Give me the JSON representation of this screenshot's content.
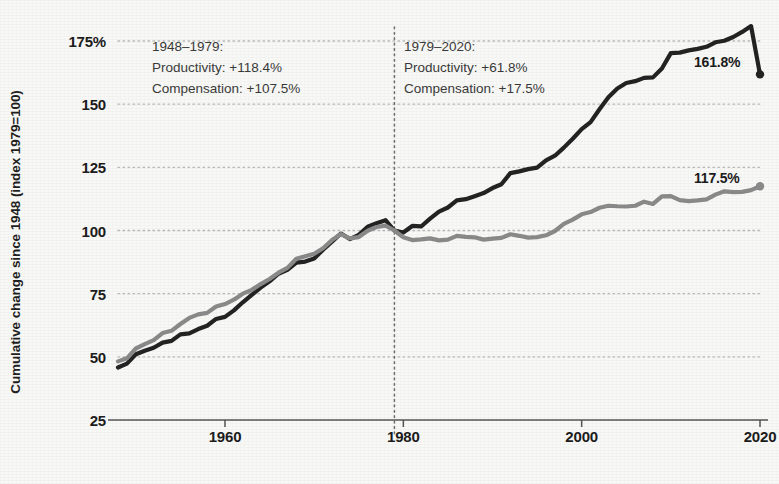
{
  "chart_data": {
    "type": "line",
    "title": "",
    "subtitle": "",
    "xlabel": "",
    "ylabel": "Cumulative change since 1948 (index 1979=100)",
    "xlim": [
      1948,
      2020
    ],
    "ylim": [
      25,
      175
    ],
    "grid": true,
    "grid_style": "dotted-horizontal",
    "legend_position": "none",
    "y_ticks": [
      "175%",
      "150",
      "125",
      "100",
      "75",
      "50",
      "25"
    ],
    "y_tick_values": [
      175,
      150,
      125,
      100,
      75,
      50,
      25
    ],
    "x_ticks": [
      "1960",
      "1980",
      "2000",
      "2020"
    ],
    "x_tick_values": [
      1960,
      1980,
      2000,
      2020
    ],
    "reference_line": {
      "x": 1979,
      "style": "dotted",
      "color": "#6e6e6e"
    },
    "colors": {
      "productivity": "#232323",
      "compensation": "#8a8a8a",
      "grid": "#b9b9b9",
      "axis": "#555555"
    },
    "series": [
      {
        "name": "Productivity",
        "color": "#232323",
        "x": [
          1948,
          1949,
          1950,
          1951,
          1952,
          1953,
          1954,
          1955,
          1956,
          1957,
          1958,
          1959,
          1960,
          1961,
          1962,
          1963,
          1964,
          1965,
          1966,
          1967,
          1968,
          1969,
          1970,
          1971,
          1972,
          1973,
          1974,
          1975,
          1976,
          1977,
          1978,
          1979,
          1980,
          1981,
          1982,
          1983,
          1984,
          1985,
          1986,
          1987,
          1988,
          1989,
          1990,
          1991,
          1992,
          1993,
          1994,
          1995,
          1996,
          1997,
          1998,
          1999,
          2000,
          2001,
          2002,
          2003,
          2004,
          2005,
          2006,
          2007,
          2008,
          2009,
          2010,
          2011,
          2012,
          2013,
          2014,
          2015,
          2016,
          2017,
          2018,
          2019,
          2020
        ],
        "values": [
          45.8,
          47.3,
          51.0,
          52.4,
          53.6,
          55.6,
          56.3,
          58.9,
          59.3,
          61.0,
          62.3,
          65.0,
          65.8,
          68.4,
          71.6,
          74.5,
          77.4,
          79.9,
          82.9,
          84.4,
          87.3,
          87.7,
          88.9,
          92.4,
          95.6,
          98.8,
          96.6,
          98.3,
          101.5,
          102.9,
          104.1,
          100.0,
          99.2,
          101.8,
          101.6,
          104.7,
          107.5,
          109.1,
          111.9,
          112.4,
          113.6,
          114.8,
          116.8,
          118.3,
          122.7,
          123.4,
          124.3,
          124.9,
          127.8,
          129.6,
          132.8,
          136.3,
          140.1,
          142.9,
          148.0,
          152.7,
          156.2,
          158.4,
          159.1,
          160.4,
          160.6,
          164.1,
          170.2,
          170.4,
          171.3,
          171.9,
          172.7,
          174.5,
          175.1,
          176.6,
          178.6,
          180.9,
          161.8
        ],
        "start_value": 45.8,
        "end_value": 161.8,
        "end_label": "161.8%"
      },
      {
        "name": "Compensation",
        "color": "#8a8a8a",
        "x": [
          1948,
          1949,
          1950,
          1951,
          1952,
          1953,
          1954,
          1955,
          1956,
          1957,
          1958,
          1959,
          1960,
          1961,
          1962,
          1963,
          1964,
          1965,
          1966,
          1967,
          1968,
          1969,
          1970,
          1971,
          1972,
          1973,
          1974,
          1975,
          1976,
          1977,
          1978,
          1979,
          1980,
          1981,
          1982,
          1983,
          1984,
          1985,
          1986,
          1987,
          1988,
          1989,
          1990,
          1991,
          1992,
          1993,
          1994,
          1995,
          1996,
          1997,
          1998,
          1999,
          2000,
          2001,
          2002,
          2003,
          2004,
          2005,
          2006,
          2007,
          2008,
          2009,
          2010,
          2011,
          2012,
          2013,
          2014,
          2015,
          2016,
          2017,
          2018,
          2019,
          2020
        ],
        "values": [
          48.2,
          49.4,
          53.3,
          55.0,
          56.6,
          59.4,
          60.3,
          63.0,
          65.4,
          66.8,
          67.4,
          69.9,
          70.9,
          72.6,
          75.0,
          76.5,
          78.8,
          80.8,
          83.3,
          85.2,
          88.8,
          89.8,
          90.8,
          93.0,
          96.2,
          98.6,
          96.9,
          97.4,
          99.9,
          101.4,
          101.9,
          100.0,
          97.3,
          96.2,
          96.5,
          96.9,
          96.1,
          96.4,
          97.9,
          97.5,
          97.3,
          96.4,
          96.8,
          97.1,
          98.5,
          97.9,
          97.2,
          97.4,
          98.1,
          99.8,
          102.6,
          104.3,
          106.4,
          107.3,
          109.0,
          109.8,
          109.6,
          109.5,
          109.8,
          111.4,
          110.5,
          113.5,
          113.6,
          112.0,
          111.6,
          111.9,
          112.3,
          114.2,
          115.5,
          115.2,
          115.3,
          116.0,
          117.5
        ],
        "start_value": 48.2,
        "end_value": 117.5,
        "end_label": "117.5%"
      }
    ],
    "annotations": [
      {
        "id": "annotation-left",
        "period": "1948–1979:",
        "lines": [
          "1948–1979:",
          "Productivity: +118.4%",
          "Compensation: +107.5%"
        ],
        "productivity_change": "+118.4%",
        "compensation_change": "+107.5%"
      },
      {
        "id": "annotation-right",
        "period": "1979–2020:",
        "lines": [
          "1979–2020:",
          "Productivity: +61.8%",
          "Compensation: +17.5%"
        ],
        "productivity_change": "+61.8%",
        "compensation_change": "+17.5%"
      }
    ]
  },
  "axis": {
    "y_title": "Cumulative change since 1948 (index 1979=100)",
    "y_labels": [
      "175%",
      "150",
      "125",
      "100",
      "75",
      "50",
      "25"
    ],
    "x_labels": [
      "1960",
      "1980",
      "2000",
      "2020"
    ]
  },
  "annotation_left": {
    "l1": "1948–1979:",
    "l2": "Productivity: +118.4%",
    "l3": "Compensation: +107.5%"
  },
  "annotation_right": {
    "l1": "1979–2020:",
    "l2": "Productivity: +61.8%",
    "l3": "Compensation: +17.5%"
  },
  "endpoints": {
    "productivity": "161.8%",
    "compensation": "117.5%"
  }
}
